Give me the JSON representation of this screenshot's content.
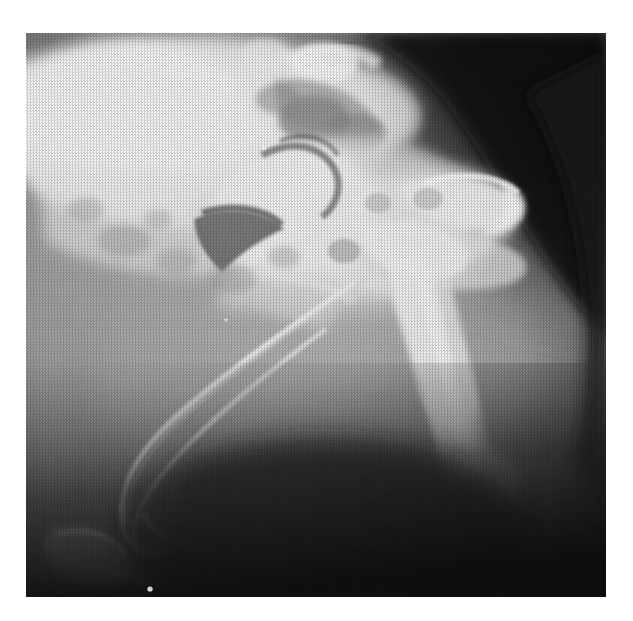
{
  "page": {
    "background_color": "#ffffff",
    "width": 633,
    "height": 621
  },
  "figure": {
    "type": "radiograph",
    "modality": "X-ray",
    "view": "lateral",
    "region": "pelvis / hip joint",
    "caption": "",
    "annotations": [],
    "alt_text": "Lateral radiograph of the pelvis and hip showing the ilium and sacrum superiorly, the femoral head and neck with the femoral shaft coursing caudoventrally, the ischium and pubis, and surrounding soft tissue shadows.",
    "frame": {
      "left": 26,
      "top": 33,
      "width": 580,
      "height": 564,
      "border_color": "#ffffff"
    },
    "tone": {
      "background_soft_tissue": "#6f6f6f",
      "dark_corner": "#141414",
      "mid_tissue": "#8a8a8a",
      "bone_mid": "#bdbdbd",
      "bone_bright": "#e6e6e6",
      "bone_peak": "#fbfbfb",
      "gas_shadow": "#3c3c3c"
    },
    "structures": [
      {
        "name": "ilium-sacrum-mass",
        "description": "broad radiopaque bony mass, upper left quadrant",
        "brightness": "bone_peak"
      },
      {
        "name": "sacral-vertebrae",
        "description": "segmented vertebral bodies along the upper margin",
        "brightness": "bone_bright"
      },
      {
        "name": "acetabulum-femoral-head",
        "description": "dense rounded articulation in centre of the image",
        "brightness": "bone_bright"
      },
      {
        "name": "femoral-shaft",
        "description": "long diagonal bone shaft running from centre to lower right",
        "brightness": "bone_bright"
      },
      {
        "name": "ischium-hook",
        "description": "hook shaped bone projecting to the right of the hip",
        "brightness": "bone_bright"
      },
      {
        "name": "pubis-cortical-line",
        "description": "thin bright cortical line sweeping to lower left",
        "brightness": "bone_mid"
      },
      {
        "name": "caudal-vertebra",
        "description": "small bony element at the lower left border",
        "brightness": "bone_mid"
      },
      {
        "name": "soft-tissue-silhouette",
        "description": "rounded soft tissue outline against dark background on the right",
        "brightness": "mid_tissue"
      },
      {
        "name": "gas-shadow",
        "description": "dark gas / bowel shadow below the hip",
        "brightness": "gas_shadow"
      },
      {
        "name": "film-marker-dot",
        "description": "small bright point artefact near the lower border",
        "brightness": "bone_peak"
      }
    ]
  }
}
